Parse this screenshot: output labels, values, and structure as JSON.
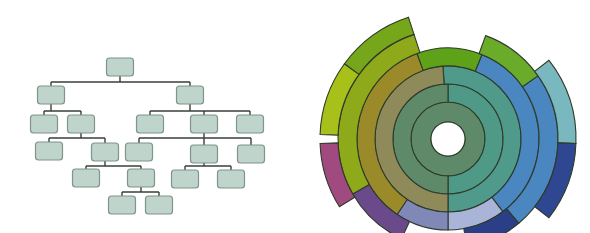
{
  "tree": {
    "node_size": {
      "w": 27,
      "h": 18
    },
    "colors": {
      "fill": "#bfd4cb",
      "stroke": "#7f948b",
      "edge": "#3a3f3c"
    },
    "nodes": [
      {
        "id": "root",
        "cx": 120,
        "cy": 67
      },
      {
        "id": "L",
        "cx": 51,
        "cy": 95
      },
      {
        "id": "R",
        "cx": 190,
        "cy": 95
      },
      {
        "id": "LL",
        "cx": 44,
        "cy": 124
      },
      {
        "id": "LR",
        "cx": 81,
        "cy": 124
      },
      {
        "id": "RL",
        "cx": 150,
        "cy": 124
      },
      {
        "id": "RM",
        "cx": 204,
        "cy": 124
      },
      {
        "id": "RR",
        "cx": 250,
        "cy": 124
      },
      {
        "id": "LRL",
        "cx": 49,
        "cy": 151
      },
      {
        "id": "LRR",
        "cx": 105,
        "cy": 152
      },
      {
        "id": "RML",
        "cx": 139,
        "cy": 152
      },
      {
        "id": "RMM",
        "cx": 204,
        "cy": 154
      },
      {
        "id": "RMR",
        "cx": 251,
        "cy": 154
      },
      {
        "id": "LRRL",
        "cx": 86,
        "cy": 178
      },
      {
        "id": "LRRR",
        "cx": 141,
        "cy": 178
      },
      {
        "id": "RMML",
        "cx": 185,
        "cy": 179
      },
      {
        "id": "RMMR",
        "cx": 231,
        "cy": 179
      },
      {
        "id": "LRRRL",
        "cx": 122,
        "cy": 205
      },
      {
        "id": "LRRRR",
        "cx": 159,
        "cy": 205
      }
    ],
    "edges": [
      {
        "parent": "root",
        "children": [
          "L",
          "R"
        ],
        "bus_y": 82
      },
      {
        "parent": "L",
        "children": [
          "LL",
          "LR"
        ],
        "bus_y": 111
      },
      {
        "parent": "R",
        "children": [
          "RL",
          "RM",
          "RR"
        ],
        "bus_y": 111
      },
      {
        "parent": "LR",
        "children": [
          "LRL",
          "LRR"
        ],
        "bus_y": 138
      },
      {
        "parent": "RM",
        "children": [
          "RML",
          "RMM",
          "RMR"
        ],
        "bus_y": 138
      },
      {
        "parent": "LRR",
        "children": [
          "LRRL",
          "LRRR"
        ],
        "bus_y": 166
      },
      {
        "parent": "RMM",
        "children": [
          "RMML",
          "RMMR"
        ],
        "bus_y": 166
      },
      {
        "parent": "LRRR",
        "children": [
          "LRRRL",
          "LRRRR"
        ],
        "bus_y": 192
      }
    ]
  },
  "sunburst": {
    "center": {
      "x": 448,
      "y": 139
    },
    "hole_radius": 17,
    "ring_stroke": "#2e3a2a",
    "segments": [
      {
        "r0": 17,
        "r1": 37,
        "a0": 0,
        "a1": 360,
        "color": "#5f8a6a"
      },
      {
        "r0": 37,
        "r1": 55,
        "a0": 0,
        "a1": 180,
        "color": "#4f9a86"
      },
      {
        "r0": 37,
        "r1": 55,
        "a0": 180,
        "a1": 360,
        "color": "#5f8a6a"
      },
      {
        "r0": 55,
        "r1": 73,
        "a0": -4,
        "a1": 180,
        "color": "#4f9a8a"
      },
      {
        "r0": 55,
        "r1": 73,
        "a0": 180,
        "a1": 356,
        "color": "#8e8a5a"
      },
      {
        "r0": 73,
        "r1": 91,
        "a0": -20,
        "a1": 22,
        "color": "#5ea21a"
      },
      {
        "r0": 73,
        "r1": 91,
        "a0": 22,
        "a1": 143,
        "color": "#4a86c0"
      },
      {
        "r0": 73,
        "r1": 91,
        "a0": 143,
        "a1": 180,
        "color": "#a9b4d8"
      },
      {
        "r0": 73,
        "r1": 91,
        "a0": 180,
        "a1": 214,
        "color": "#8088b8"
      },
      {
        "r0": 73,
        "r1": 91,
        "a0": 214,
        "a1": 340,
        "color": "#9a8a2a"
      },
      {
        "r0": 91,
        "r1": 110,
        "a0": 20,
        "a1": 55,
        "color": "#6aac2a"
      },
      {
        "r0": 91,
        "r1": 110,
        "a0": 55,
        "a1": 140,
        "color": "#4a86c0"
      },
      {
        "r0": 91,
        "r1": 110,
        "a0": 140,
        "a1": 170,
        "color": "#2a3f88"
      },
      {
        "r0": 91,
        "r1": 110,
        "a0": 205,
        "a1": 240,
        "color": "#6a4a8a"
      },
      {
        "r0": 91,
        "r1": 110,
        "a0": 240,
        "a1": 342,
        "color": "#8eaa1a"
      },
      {
        "r0": 110,
        "r1": 128,
        "a0": 52,
        "a1": 92,
        "color": "#7ab8c0"
      },
      {
        "r0": 110,
        "r1": 128,
        "a0": 92,
        "a1": 128,
        "color": "#2f4690"
      },
      {
        "r0": 110,
        "r1": 128,
        "a0": 238,
        "a1": 268,
        "color": "#a04a80"
      },
      {
        "r0": 110,
        "r1": 128,
        "a0": 272,
        "a1": 306,
        "color": "#a8c01a"
      },
      {
        "r0": 110,
        "r1": 128,
        "a0": 306,
        "a1": 342,
        "color": "#76a61a"
      }
    ]
  }
}
